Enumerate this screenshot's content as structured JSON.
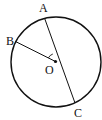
{
  "diagram": {
    "type": "circle-geometry",
    "circle": {
      "cx": 56,
      "cy": 62,
      "r": 45,
      "stroke": "#111111"
    },
    "center": {
      "label": "O",
      "x": 55.5,
      "y": 61.5,
      "label_x": 45,
      "label_y": 74
    },
    "points": [
      {
        "label": "A",
        "x": 44.5,
        "y": 18,
        "label_x": 39,
        "label_y": 12
      },
      {
        "label": "B",
        "x": 15.5,
        "y": 41.5,
        "label_x": 6,
        "label_y": 45
      },
      {
        "label": "C",
        "x": 75,
        "y": 103,
        "label_x": 74,
        "label_y": 117
      }
    ],
    "segments": [
      {
        "from": "A",
        "to": "C",
        "note": "diameter through O"
      },
      {
        "from": "B",
        "to": "O",
        "note": "radius"
      }
    ],
    "angle_mark": {
      "vertex": "O",
      "between": [
        "A",
        "B"
      ],
      "radius": 8
    }
  }
}
